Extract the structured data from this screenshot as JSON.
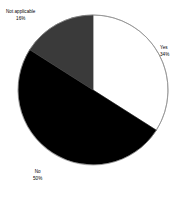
{
  "chart_data": {
    "type": "pie",
    "title": "",
    "subtitle": "",
    "xlabel": "",
    "ylabel": "",
    "grid": false,
    "legend": "none",
    "start_angle_deg": 0,
    "direction": "clockwise",
    "categories": [
      "Yes",
      "No",
      "Not applicable"
    ],
    "values": [
      34,
      50,
      16
    ],
    "value_unit": "%",
    "labels": [
      {
        "name": "Yes",
        "pct": "34%",
        "value": 34,
        "color": "#ffffff",
        "label_position": "right"
      },
      {
        "name": "No",
        "pct": "50%",
        "value": 50,
        "color": "#000000",
        "label_position": "bottom-left"
      },
      {
        "name": "Not applicable",
        "pct": "16%",
        "value": 16,
        "color": "#3a3a3a",
        "label_position": "top-left"
      }
    ],
    "slice_outline_color": "#8c8c8c",
    "background_color": "#ffffff"
  },
  "slices": {
    "yes": {
      "name": "Yes",
      "pct": "34%"
    },
    "no": {
      "name": "No",
      "pct": "50%"
    },
    "not_applicable": {
      "name": "Not applicable",
      "pct": "16%"
    }
  }
}
